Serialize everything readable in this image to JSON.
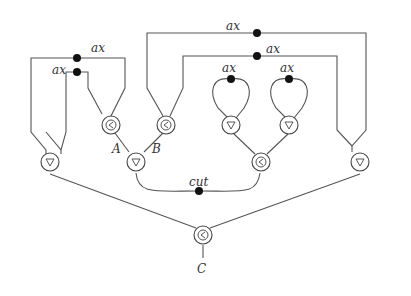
{
  "diagram": {
    "type": "proof-net",
    "labels": {
      "ax1": "ax",
      "ax2": "ax",
      "ax3": "ax",
      "ax4": "ax",
      "ax5": "ax",
      "ax6": "ax",
      "cut": "cut",
      "A": "A",
      "B": "B",
      "C": "C"
    },
    "nodes": [
      {
        "id": "par-A",
        "symbol": "⅋",
        "kind": "par-left"
      },
      {
        "id": "par-B",
        "symbol": "⅋",
        "kind": "par-left"
      },
      {
        "id": "tensor-AB",
        "symbol": "▽",
        "kind": "tensor"
      },
      {
        "id": "tensor-left",
        "symbol": "▽",
        "kind": "tensor"
      },
      {
        "id": "tensor-loop1",
        "symbol": "▽",
        "kind": "tensor"
      },
      {
        "id": "tensor-loop2",
        "symbol": "▽",
        "kind": "tensor"
      },
      {
        "id": "par-mid",
        "symbol": "⅋",
        "kind": "par-left"
      },
      {
        "id": "tensor-right",
        "symbol": "▽",
        "kind": "tensor"
      },
      {
        "id": "par-C",
        "symbol": "⅋",
        "kind": "par-left"
      }
    ]
  }
}
